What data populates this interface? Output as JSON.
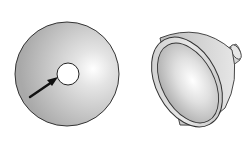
{
  "figure": {
    "background": "#ffffff",
    "objects": [
      {
        "name": "flat-disc-with-center-hole",
        "annotation": "arrow pointing to center hole"
      },
      {
        "name": "parabolic-reflector-dish"
      }
    ],
    "colors": {
      "outline": "#333333",
      "fill_dark": "#a8a8a8",
      "fill_light": "#f2f2f2",
      "arrow": "#111111"
    }
  }
}
